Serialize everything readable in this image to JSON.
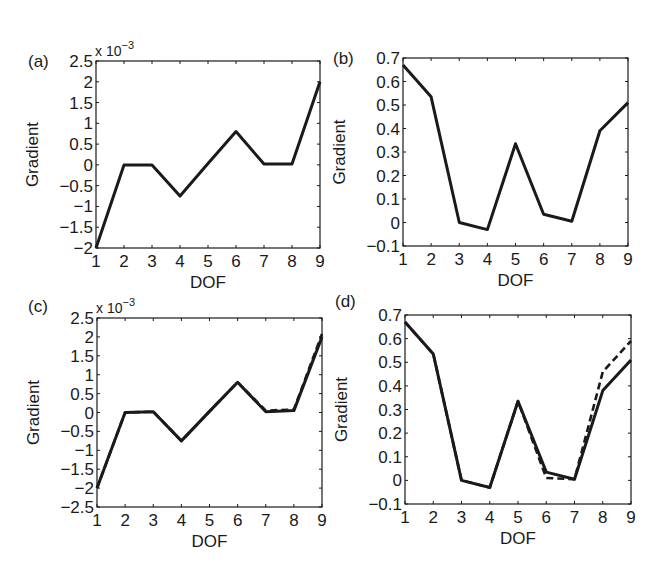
{
  "chart_data": [
    {
      "panel": "(a)",
      "type": "line",
      "title": "",
      "xlabel": "DOF",
      "ylabel": "Gradient",
      "y_multiplier": "x 10^-3",
      "x": [
        1,
        2,
        3,
        4,
        5,
        6,
        7,
        8,
        9
      ],
      "xlim": [
        1,
        9
      ],
      "ylim": [
        -2,
        2.5
      ],
      "yticks": [
        -2,
        -1.5,
        -1,
        -0.5,
        0,
        0.5,
        1,
        1.5,
        2,
        2.5
      ],
      "ytick_labels": [
        "−2",
        "−1.5",
        "−1",
        "−0.5",
        "0",
        "0.5",
        "1",
        "1.5",
        "2",
        "2.5"
      ],
      "grid": false,
      "series": [
        {
          "name": "solid",
          "style": "solid",
          "values": [
            -2.0,
            0.0,
            0.0,
            -0.75,
            0.03,
            0.8,
            0.02,
            0.02,
            2.0
          ]
        }
      ]
    },
    {
      "panel": "(b)",
      "type": "line",
      "title": "",
      "xlabel": "DOF",
      "ylabel": "Gradient",
      "x": [
        1,
        2,
        3,
        4,
        5,
        6,
        7,
        8,
        9
      ],
      "xlim": [
        1,
        9
      ],
      "ylim": [
        -0.1,
        0.7
      ],
      "yticks": [
        -0.1,
        0,
        0.1,
        0.2,
        0.3,
        0.4,
        0.5,
        0.6,
        0.7
      ],
      "ytick_labels": [
        "−0.1",
        "0",
        "0.1",
        "0.2",
        "0.3",
        "0.4",
        "0.5",
        "0.6",
        "0.7"
      ],
      "grid": false,
      "series": [
        {
          "name": "solid",
          "style": "solid",
          "values": [
            0.67,
            0.535,
            0.0,
            -0.03,
            0.335,
            0.035,
            0.005,
            0.39,
            0.51
          ]
        }
      ]
    },
    {
      "panel": "(c)",
      "type": "line",
      "title": "",
      "xlabel": "DOF",
      "ylabel": "Gradient",
      "y_multiplier": "x 10^-3",
      "x": [
        1,
        2,
        3,
        4,
        5,
        6,
        7,
        8,
        9
      ],
      "xlim": [
        1,
        9
      ],
      "ylim": [
        -2.5,
        2.5
      ],
      "yticks": [
        -2.5,
        -2,
        -1.5,
        -1,
        -0.5,
        0,
        0.5,
        1,
        1.5,
        2,
        2.5
      ],
      "ytick_labels": [
        "−2.5",
        "−2",
        "−1.5",
        "−1",
        "−0.5",
        "0",
        "0.5",
        "1",
        "1.5",
        "2",
        "2.5"
      ],
      "grid": false,
      "series": [
        {
          "name": "solid",
          "style": "solid",
          "values": [
            -2.0,
            0.0,
            0.02,
            -0.75,
            0.03,
            0.8,
            0.02,
            0.05,
            2.0
          ]
        },
        {
          "name": "dashed",
          "style": "dashed",
          "values": [
            -2.0,
            0.0,
            0.02,
            -0.75,
            0.03,
            0.8,
            0.05,
            0.08,
            2.08
          ]
        }
      ]
    },
    {
      "panel": "(d)",
      "type": "line",
      "title": "",
      "xlabel": "DOF",
      "ylabel": "Gradient",
      "x": [
        1,
        2,
        3,
        4,
        5,
        6,
        7,
        8,
        9
      ],
      "xlim": [
        1,
        9
      ],
      "ylim": [
        -0.1,
        0.7
      ],
      "yticks": [
        -0.1,
        0,
        0.1,
        0.2,
        0.3,
        0.4,
        0.5,
        0.6,
        0.7
      ],
      "ytick_labels": [
        "−0.1",
        "0",
        "0.1",
        "0.2",
        "0.3",
        "0.4",
        "0.5",
        "0.6",
        "0.7"
      ],
      "grid": false,
      "series": [
        {
          "name": "solid",
          "style": "solid",
          "values": [
            0.67,
            0.535,
            0.0,
            -0.03,
            0.335,
            0.035,
            0.005,
            0.38,
            0.51
          ]
        },
        {
          "name": "dashed",
          "style": "dashed",
          "values": [
            0.67,
            0.535,
            0.0,
            -0.03,
            0.335,
            0.01,
            0.005,
            0.46,
            0.59
          ]
        }
      ]
    }
  ],
  "layout": {
    "frames": [
      {
        "left": 96,
        "top": 61,
        "right": 320,
        "bottom": 248
      },
      {
        "left": 403,
        "top": 58,
        "right": 628,
        "bottom": 246
      },
      {
        "left": 97,
        "top": 318,
        "right": 322,
        "bottom": 507
      },
      {
        "left": 405,
        "top": 315,
        "right": 631,
        "bottom": 504
      }
    ],
    "line_color": "#1a1a1a"
  }
}
